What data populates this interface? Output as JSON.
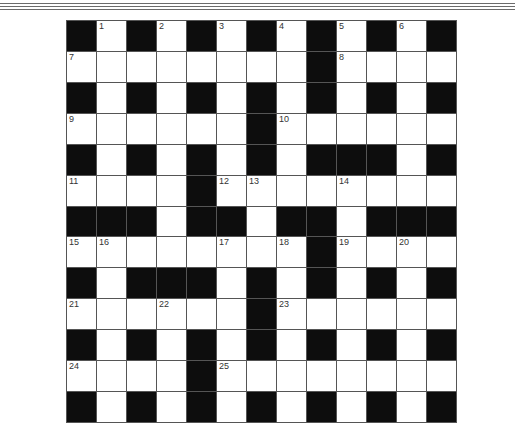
{
  "puzzle": {
    "type": "crossword",
    "rows": 13,
    "cols": 13,
    "grid": [
      "#.#.#.#.#.#.#",
      "........#....",
      "#.#.#.#.#.#.#",
      "......#......",
      "#.#.#.#.###.#",
      "....#........",
      "###.##.##.###",
      "........#....",
      "#.###.#.#.#.#",
      "......#......",
      "#.#.#.#.#.#.#",
      "....#........",
      "#.#.#.#.#.#.#"
    ],
    "numbers": [
      {
        "r": 0,
        "c": 1,
        "n": "1"
      },
      {
        "r": 0,
        "c": 3,
        "n": "2"
      },
      {
        "r": 0,
        "c": 5,
        "n": "3"
      },
      {
        "r": 0,
        "c": 7,
        "n": "4"
      },
      {
        "r": 0,
        "c": 9,
        "n": "5"
      },
      {
        "r": 0,
        "c": 11,
        "n": "6"
      },
      {
        "r": 1,
        "c": 0,
        "n": "7"
      },
      {
        "r": 1,
        "c": 9,
        "n": "8"
      },
      {
        "r": 3,
        "c": 0,
        "n": "9"
      },
      {
        "r": 3,
        "c": 7,
        "n": "10"
      },
      {
        "r": 5,
        "c": 0,
        "n": "11"
      },
      {
        "r": 5,
        "c": 5,
        "n": "12"
      },
      {
        "r": 5,
        "c": 6,
        "n": "13"
      },
      {
        "r": 5,
        "c": 9,
        "n": "14"
      },
      {
        "r": 7,
        "c": 0,
        "n": "15"
      },
      {
        "r": 7,
        "c": 1,
        "n": "16"
      },
      {
        "r": 7,
        "c": 5,
        "n": "17"
      },
      {
        "r": 7,
        "c": 7,
        "n": "18"
      },
      {
        "r": 7,
        "c": 9,
        "n": "19"
      },
      {
        "r": 7,
        "c": 11,
        "n": "20"
      },
      {
        "r": 9,
        "c": 0,
        "n": "21"
      },
      {
        "r": 9,
        "c": 3,
        "n": "22"
      },
      {
        "r": 9,
        "c": 7,
        "n": "23"
      },
      {
        "r": 11,
        "c": 0,
        "n": "24"
      },
      {
        "r": 11,
        "c": 5,
        "n": "25"
      }
    ]
  },
  "colors": {
    "black_cell": "#0d0d0d",
    "white_cell": "#ffffff",
    "grid_line": "#555555",
    "number_text": "#333333"
  }
}
